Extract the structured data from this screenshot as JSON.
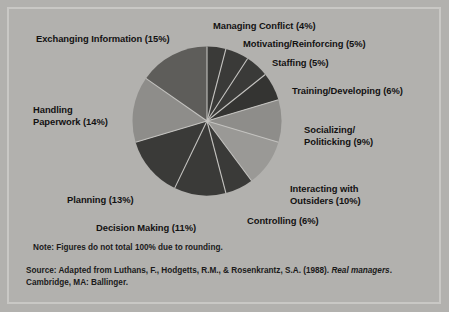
{
  "chart_data": {
    "type": "pie",
    "title": "",
    "subtitle": "",
    "xlabel": "",
    "ylabel": "",
    "legend_position": "none",
    "grid": false,
    "units": "percent",
    "start_angle_deg": 0,
    "direction": "clockwise",
    "categories": [
      "Managing Conflict",
      "Motivating/Reinforcing",
      "Staffing",
      "Training/Developing",
      "Socializing/Politicking",
      "Interacting with Outsiders",
      "Controlling",
      "Decision Making",
      "Planning",
      "Handling Paperwork",
      "Exchanging Information"
    ],
    "values": [
      4,
      5,
      5,
      6,
      9,
      10,
      6,
      11,
      13,
      14,
      15
    ],
    "total": 98,
    "slice_colors": [
      "#3a3a38",
      "#3a3a38",
      "#3a3a38",
      "#343432",
      "#8e8d8a",
      "#9a9996",
      "#3a3a38",
      "#3a3a38",
      "#3a3a38",
      "#8e8d8a",
      "#5e5d5a"
    ],
    "separator_color": "#c3c2bf",
    "slices": [
      {
        "label": "Managing Conflict (4%)",
        "name": "Managing Conflict",
        "value": 4
      },
      {
        "label": "Motivating/Reinforcing (5%)",
        "name": "Motivating/Reinforcing",
        "value": 5
      },
      {
        "label": "Staffing (5%)",
        "name": "Staffing",
        "value": 5
      },
      {
        "label": "Training/Developing (6%)",
        "name": "Training/Developing",
        "value": 6
      },
      {
        "label": "Socializing/\nPoliticking (9%)",
        "name": "Socializing/Politicking",
        "value": 9
      },
      {
        "label": "Interacting with\nOutsiders (10%)",
        "name": "Interacting with Outsiders",
        "value": 10
      },
      {
        "label": "Controlling (6%)",
        "name": "Controlling",
        "value": 6
      },
      {
        "label": "Decision Making (11%)",
        "name": "Decision Making",
        "value": 11
      },
      {
        "label": "Planning (13%)",
        "name": "Planning",
        "value": 13
      },
      {
        "label": "Handling\nPaperwork (14%)",
        "name": "Handling Paperwork",
        "value": 14
      },
      {
        "label": "Exchanging Information (15%)",
        "name": "Exchanging Information",
        "value": 15
      }
    ]
  },
  "labels": {
    "exchanging_information": "Exchanging Information (15%)",
    "managing_conflict": "Managing Conflict (4%)",
    "motivating_reinforcing": "Motivating/Reinforcing (5%)",
    "staffing": "Staffing (5%)",
    "training_developing": "Training/Developing (6%)",
    "socializing_politicking": "Socializing/\nPoliticking (9%)",
    "handling_paperwork": "Handling\nPaperwork (14%)",
    "interacting_with_outsiders": "Interacting with\nOutsiders (10%)",
    "planning": "Planning (13%)",
    "controlling": "Controlling (6%)",
    "decision_making": "Decision Making (11%)"
  },
  "footnotes": {
    "note": "Note: Figures do not total 100% due to rounding.",
    "source_prefix": "Source: Adapted from Luthans, F., Hodgetts, R.M., & Rosenkrantz, S.A. (1988). ",
    "source_italic": "Real managers",
    "source_suffix": ". Cambridge, MA: Ballinger."
  },
  "theme": {
    "panel_background": "#b2b1ae",
    "panel_border": "#c9c8c5",
    "text_color": "#121212"
  }
}
